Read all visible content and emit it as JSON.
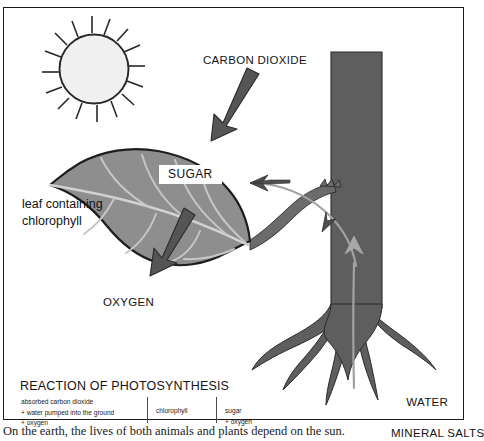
{
  "diagram": {
    "title": "Photosynthesis",
    "labels": {
      "carbon_dioxide": "CARBON DIOXIDE",
      "oxygen": "OXYGEN",
      "sugar": "SUGAR",
      "leaf": "leaf containing\nchlorophyll",
      "water": "WATER",
      "mineral_salts": "MINERAL SALTS"
    },
    "reaction": {
      "title": "REACTION OF PHOTOSYNTHESIS",
      "reactants": "absorbed carbon dioxide\n+ water pumped into the ground\n+ oxygen",
      "catalyst": "chlorophyll",
      "products": "sugar\n+ oxygen"
    }
  },
  "caption": {
    "text": "On the earth, the lives of both animals and plants depend on the sun."
  },
  "colors": {
    "leaf_fill": "#8e8e8e",
    "leaf_vein": "#cfcfcf",
    "trunk_fill": "#606060",
    "arrow_dark": "#555555",
    "arrow_light": "#9a9a9a",
    "sun_fill": "#f0f0f0",
    "outline": "#1b1b1b",
    "frame": "#1b1b1b"
  },
  "icons": {
    "sun": "sun-icon",
    "leaf": "leaf-icon",
    "tree_trunk": "tree-trunk-icon",
    "roots": "tree-roots-icon",
    "arrow_co2": "arrow-down-icon",
    "arrow_o2": "arrow-down-left-icon",
    "arrow_sap": "arrow-flow-icon"
  }
}
